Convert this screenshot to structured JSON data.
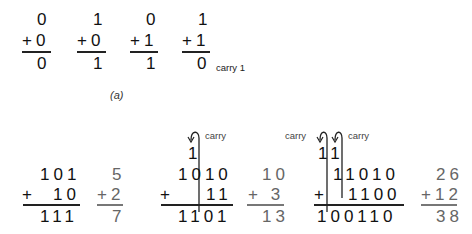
{
  "part_a": {
    "caption": "(a)",
    "problems": [
      {
        "top": "0",
        "bottom": "+0",
        "result": "0"
      },
      {
        "top": "1",
        "bottom": "+0",
        "result": "1"
      },
      {
        "top": "0",
        "bottom": "+1",
        "result": "1"
      },
      {
        "top": "1",
        "bottom": "+1",
        "result": "0",
        "note": "carry 1"
      }
    ]
  },
  "part_b": {
    "examples": [
      {
        "binary": {
          "carries": "",
          "top": "101",
          "operator": "+",
          "bottom": "10",
          "result": "111"
        },
        "decimal": {
          "top": "5",
          "bottom": "+2",
          "result": "7"
        }
      },
      {
        "binary": {
          "carry_labels": [
            "carry"
          ],
          "carries": "1",
          "top": "1010",
          "operator": "+",
          "bottom": "11",
          "result": "1101"
        },
        "decimal": {
          "top": "10",
          "bottom": "+ 3",
          "result": "13"
        }
      },
      {
        "binary": {
          "carry_labels": [
            "carry",
            "carry"
          ],
          "carries": "11",
          "top": "11010",
          "operator": "+",
          "bottom": "1100",
          "result": "100110"
        },
        "decimal": {
          "top": "26",
          "bottom": "+12",
          "result": "38"
        }
      }
    ]
  }
}
